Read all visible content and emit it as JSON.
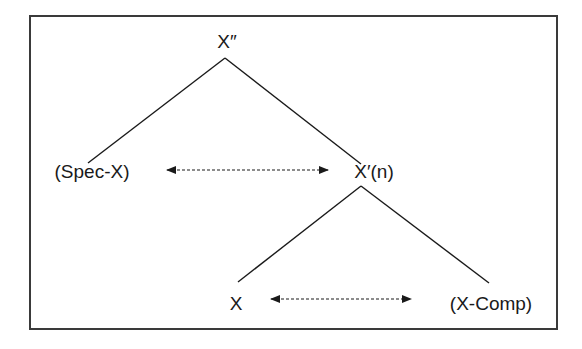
{
  "diagram": {
    "type": "x-bar-tree",
    "nodes": {
      "root": {
        "label": "X″",
        "x": 227,
        "y": 48
      },
      "specifier": {
        "label": "(Spec-X)",
        "x": 92,
        "y": 178
      },
      "bar": {
        "label": "X′(n)",
        "x": 374,
        "y": 178
      },
      "head": {
        "label": "X",
        "x": 236,
        "y": 310
      },
      "complement": {
        "label": "(X-Comp)",
        "x": 491,
        "y": 310
      }
    },
    "edges": [
      {
        "from": "root",
        "to": "specifier"
      },
      {
        "from": "root",
        "to": "bar"
      },
      {
        "from": "bar",
        "to": "head"
      },
      {
        "from": "bar",
        "to": "complement"
      }
    ],
    "relations": [
      {
        "between": [
          "specifier",
          "bar"
        ],
        "style": "dashed-double-arrow"
      },
      {
        "between": [
          "head",
          "complement"
        ],
        "style": "dashed-double-arrow"
      }
    ],
    "colors": {
      "line": "#1a1a1a",
      "frame": "#3a3a3a",
      "background": "#ffffff"
    }
  }
}
